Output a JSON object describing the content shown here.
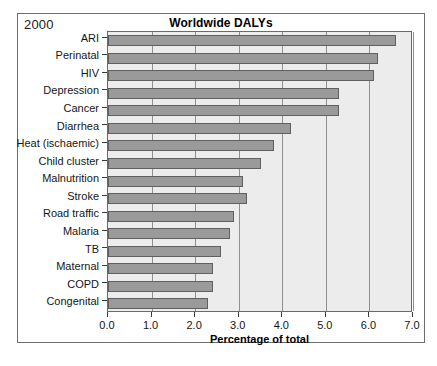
{
  "figure": {
    "corner_label": "2000",
    "title": "Worldwide DALYs"
  },
  "axis": {
    "xlabel": "Percentage of total",
    "xticks": [
      "0.0",
      "1.0",
      "2.0",
      "3.0",
      "4.0",
      "5.0",
      "6.0",
      "7.0"
    ]
  },
  "colors": {
    "bar_fill": "#9a9a9a",
    "bar_edge": "#5f5f5f",
    "plot_background": "#ececed",
    "gridline": "#8f8f8f",
    "frame": "#6e6e6e",
    "text": "#161616"
  },
  "chart_data": {
    "type": "bar",
    "orientation": "horizontal",
    "title": "Worldwide DALYs",
    "subtitle": "2000",
    "xlabel": "Percentage of total",
    "ylabel": "",
    "xlim": [
      0.0,
      7.0
    ],
    "xticks": [
      0.0,
      1.0,
      2.0,
      3.0,
      4.0,
      5.0,
      6.0,
      7.0
    ],
    "grid": true,
    "grid_axis": "x",
    "legend": false,
    "categories": [
      "ARI",
      "Perinatal",
      "HIV",
      "Depression",
      "Cancer",
      "Diarrhea",
      "Heat (ischaemic)",
      "Child cluster",
      "Malnutrition",
      "Stroke",
      "Road traffic",
      "Malaria",
      "TB",
      "Maternal",
      "COPD",
      "Congenital"
    ],
    "values": [
      6.6,
      6.2,
      6.1,
      5.3,
      5.3,
      4.2,
      3.8,
      3.5,
      3.1,
      3.2,
      2.9,
      2.8,
      2.6,
      2.4,
      2.4,
      2.3
    ]
  }
}
